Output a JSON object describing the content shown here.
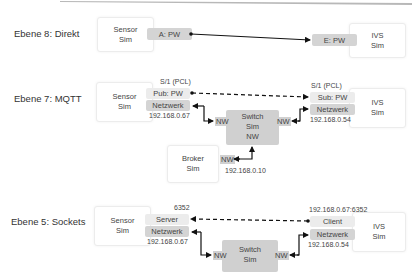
{
  "rows": [
    {
      "title": "Ebene 8: Direkt",
      "left_sim": "Sensor\nSim",
      "right_sim": "IVS\nSim",
      "left_port": "A: PW",
      "right_port": "E: PW"
    },
    {
      "title": "Ebene 7: MQTT",
      "left_sim": "Sensor\nSim",
      "right_sim": "IVS\nSim",
      "left_top_caption": "S/1 (PCL)",
      "right_top_caption": "S/1 (PCL)",
      "left_port": "Pub: PW",
      "right_port": "Sub: PW",
      "left_net": "Netzwerk",
      "right_net": "Netzwerk",
      "left_ip": "192.168.0.67",
      "right_ip": "192.168.0.54",
      "switch": {
        "line1": "Switch",
        "line2": "Sim",
        "line3": "NW",
        "left_nw": "NW",
        "right_nw": "NW"
      },
      "broker": {
        "line1": "Broker",
        "line2": "Sim",
        "nw": "NW",
        "ip": "192.168.0.10"
      }
    },
    {
      "title": "Ebene 5: Sockets",
      "left_sim": "Sensor\nSim",
      "right_sim": "IVS\nSim",
      "left_top_caption": "6352",
      "right_top_caption": "192.168.0.67:6352",
      "left_port": "Server",
      "right_port": "Client",
      "left_net": "Netzwerk",
      "right_net": "Netzwerk",
      "left_ip": "192.168.0.67",
      "right_ip": "192.168.0.54",
      "switch": {
        "line1": "Switch",
        "line2": "Sim",
        "left_nw": "NW",
        "right_nw": "NW"
      }
    }
  ],
  "labels": {
    "sensor": "Sensor",
    "ivs": "IVS",
    "sim": "Sim"
  }
}
